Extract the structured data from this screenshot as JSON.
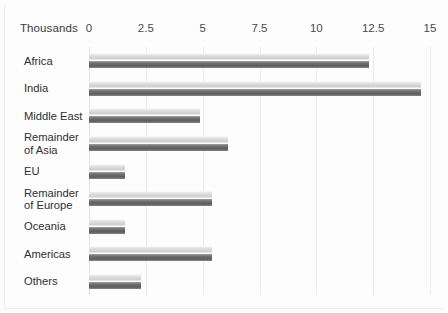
{
  "chart_data": {
    "type": "bar",
    "orientation": "horizontal",
    "title": "",
    "xlabel": "Thousands",
    "ylabel": "",
    "unit_note": "Thousands",
    "categories": [
      "Africa",
      "India",
      "Middle East",
      "Remainder of Asia",
      "EU",
      "Remainder of Europe",
      "Oceania",
      "Americas",
      "Others"
    ],
    "values": [
      12.3,
      14.6,
      4.9,
      6.1,
      1.6,
      5.4,
      1.6,
      5.4,
      2.3
    ],
    "xlim": [
      0,
      15
    ],
    "xticks": [
      0,
      2.5,
      5,
      7.5,
      10,
      12.5,
      15
    ],
    "xtick_labels": [
      "0",
      "2.5",
      "5",
      "7.5",
      "10",
      "12.5",
      "15"
    ],
    "grid": true,
    "grid_axis": "x",
    "legend": false,
    "bar_color": "#6d6d6d",
    "bar_highlight_color": "#d6d6d6",
    "grid_color": "#eceaea",
    "background_color": "#fdfdfd"
  },
  "axis": {
    "unit_caption": "Thousands"
  },
  "categories_display": [
    {
      "lines": [
        "Africa"
      ]
    },
    {
      "lines": [
        "India"
      ]
    },
    {
      "lines": [
        "Middle East"
      ]
    },
    {
      "lines": [
        "Remainder",
        "of Asia"
      ]
    },
    {
      "lines": [
        "EU"
      ]
    },
    {
      "lines": [
        "Remainder",
        "of Europe"
      ]
    },
    {
      "lines": [
        "Oceania"
      ]
    },
    {
      "lines": [
        "Americas"
      ]
    },
    {
      "lines": [
        "Others"
      ]
    }
  ]
}
